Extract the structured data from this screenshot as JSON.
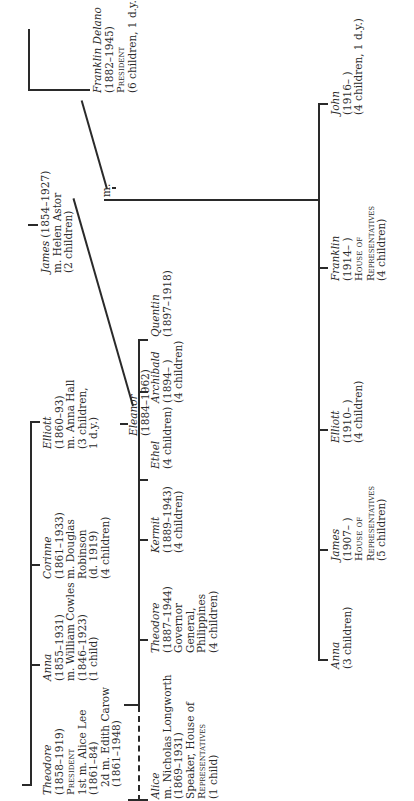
{
  "chart_title": "Roosevelt family tree",
  "generation1": [
    {
      "name": "Theodore",
      "dates": "(1858–1919)",
      "title": "President",
      "spouse1": "1st m. Alice Lee",
      "spouse1_dates": "(1861–84)",
      "spouse2": "2d m. Edith Carow",
      "spouse2_dates": "(1861–1948)"
    },
    {
      "name": "Anna",
      "dates": "(1855–1931)",
      "spouse": "m. William Cowles",
      "spouse_dates": "(1846–1923)",
      "children": "(1 child)"
    },
    {
      "name": "Corinne",
      "dates": "(1861–1933)",
      "spouse": "m. Douglas",
      "spouse2": "Robinson",
      "spouse_dates": "(d. 1919)",
      "children": "(4 children)"
    },
    {
      "name": "Elliott",
      "dates": "(1860–93)",
      "spouse": "m. Anna Hall",
      "children": "(3 children,",
      "children2": "1 d.y.)"
    }
  ],
  "james_sr": {
    "name": "James",
    "dates": "(1854–1927)",
    "spouse": "m. Helen Astor",
    "children": "(2 children)"
  },
  "fdr": {
    "name": "Franklin Delano",
    "dates": "(1882–1945)",
    "title": "President",
    "children": "(6 children, 1 d.y.)"
  },
  "eleanor": {
    "name": "Eleanor",
    "dates": "(1884–1962)"
  },
  "marriage_label": "m.",
  "theodore_children": [
    {
      "name": "Alice",
      "l1": "m. Nicholas Longworth",
      "l2": "(1869–1931)",
      "l3": "Speaker, House of",
      "l4": "Representatives",
      "l5": "(1 child)"
    },
    {
      "name": "Theodore",
      "l1": "(1887–1944)",
      "l2": "Governor",
      "l3": "General,",
      "l4": "Philippines",
      "l5": "(4 children)"
    },
    {
      "name": "Kermit",
      "l1": "(1889–1943)",
      "l2": "(4 children)"
    },
    {
      "name": "Ethel",
      "l1": "(4 children)"
    },
    {
      "name": "Archibald",
      "l1": "(1894–    )",
      "l2": "(4 children)"
    },
    {
      "name": "Quentin",
      "l1": "(1897–1918)"
    }
  ],
  "fdr_children": [
    {
      "name": "Anna",
      "l1": "(3 children)"
    },
    {
      "name": "James",
      "l1": "(1907–    )",
      "l2": "House of",
      "l3": "Representatives",
      "l4": "(5 children)"
    },
    {
      "name": "Elliott",
      "l1": "(1910–    )",
      "l2": "(4 children)"
    },
    {
      "name": "Franklin",
      "l1": "(1914–    )",
      "l2": "House of",
      "l3": "Representatives",
      "l4": "(4 children)"
    },
    {
      "name": "John",
      "l1": "(1916–    )",
      "l2": "(4 children, 1 d.y.)"
    }
  ]
}
